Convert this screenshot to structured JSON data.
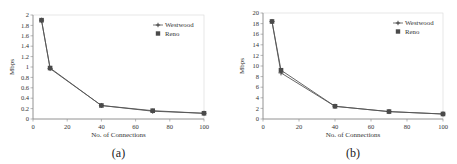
{
  "chart_data": [
    {
      "type": "line",
      "caption": "(a)",
      "title": "",
      "xlabel": "No. of Connections",
      "ylabel": "Mbps",
      "xlim": [
        0,
        100
      ],
      "ylim": [
        0,
        2
      ],
      "xticks": [
        0,
        20,
        40,
        60,
        80,
        100
      ],
      "yticks": [
        0,
        0.2,
        0.4,
        0.6,
        0.8,
        1,
        1.2,
        1.4,
        1.6,
        1.8,
        2
      ],
      "ytick_labels": [
        "0",
        "0.2",
        "0.4",
        "0.6",
        "0.8",
        "1",
        "1.2",
        "1.4",
        "1.6",
        "1.8",
        "2"
      ],
      "grid": false,
      "legend_position": "upper right",
      "x": [
        5,
        10,
        40,
        70,
        100
      ],
      "series": [
        {
          "name": "Westwood",
          "marker": "plus",
          "values": [
            1.9,
            0.97,
            0.26,
            0.15,
            0.11
          ]
        },
        {
          "name": "Reno",
          "marker": "square",
          "values": [
            1.9,
            0.98,
            0.26,
            0.16,
            0.11
          ]
        }
      ]
    },
    {
      "type": "line",
      "caption": "(b)",
      "title": "",
      "xlabel": "No. of Connections",
      "ylabel": "Mbps",
      "xlim": [
        0,
        100
      ],
      "ylim": [
        0,
        20
      ],
      "xticks": [
        0,
        20,
        40,
        60,
        80,
        100
      ],
      "yticks": [
        0,
        2,
        4,
        6,
        8,
        10,
        12,
        14,
        16,
        18,
        20
      ],
      "ytick_labels": [
        "0",
        "2",
        "4",
        "6",
        "8",
        "10",
        "12",
        "14",
        "16",
        "18",
        "20"
      ],
      "grid": false,
      "legend_position": "upper right",
      "x": [
        5,
        10,
        40,
        70,
        100
      ],
      "series": [
        {
          "name": "Westwood",
          "marker": "plus",
          "values": [
            18.4,
            8.7,
            2.4,
            1.4,
            0.95
          ]
        },
        {
          "name": "Reno",
          "marker": "square",
          "values": [
            18.4,
            9.2,
            2.4,
            1.4,
            0.95
          ]
        }
      ]
    }
  ],
  "colors": {
    "line": "#555555",
    "marker": "#4a4a4a",
    "axis": "#888888",
    "text": "#333333"
  }
}
